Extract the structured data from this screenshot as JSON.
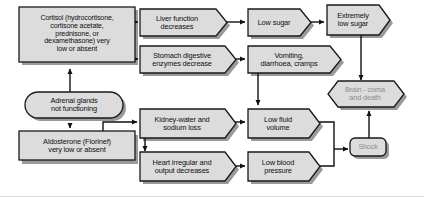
{
  "diagram": {
    "colors": {
      "node_fill": "#dcdcdc",
      "node_stroke": "#1a1a1a",
      "node_shadow": "#9a9a9a",
      "text": "#101010",
      "muted_text": "#8d8d8d",
      "connector": "#111111",
      "background": "#ffffff"
    },
    "nodes": [
      {
        "id": "cortisol",
        "shape": "rectangle",
        "text": "Cortisol (hydrocortisone,\ncortisone acetate,\nprednisone, or\ndexamethasone) very\nlow or absent",
        "muted": false
      },
      {
        "id": "liver-function",
        "shape": "chevron",
        "text": "Liver function\ndecreases",
        "muted": false
      },
      {
        "id": "stomach-enzymes",
        "shape": "chevron",
        "text": "Stomach digestive\nenzymes decrease",
        "muted": false
      },
      {
        "id": "low-sugar",
        "shape": "chevron",
        "text": "Low sugar",
        "muted": false
      },
      {
        "id": "vomiting",
        "shape": "chevron",
        "text": "Vomiting,\ndiarrhoea, cramps",
        "muted": false
      },
      {
        "id": "extremely-low-sugar",
        "shape": "chevron",
        "text": "Extremely\nlow sugar",
        "muted": false
      },
      {
        "id": "adrenal-glands",
        "shape": "rounded",
        "text": "Adrenal glands\nnot functioning",
        "muted": false
      },
      {
        "id": "aldosterone",
        "shape": "rectangle",
        "text": "Aldosterone (Florinef)\nvery low or absent",
        "muted": false
      },
      {
        "id": "kidney-loss",
        "shape": "chevron",
        "text": "Kidney-water and\nsodium loss",
        "muted": false
      },
      {
        "id": "heart-irregular",
        "shape": "chevron",
        "text": "Heart irregular and\noutput decreases",
        "muted": false
      },
      {
        "id": "low-fluid-volume",
        "shape": "chevron",
        "text": "Low fluid\nvolume",
        "muted": false
      },
      {
        "id": "low-blood-pressure",
        "shape": "chevron",
        "text": "Low blood\npressure",
        "muted": false
      },
      {
        "id": "shock",
        "shape": "rounded",
        "text": "Shock",
        "muted": true
      },
      {
        "id": "brain-coma",
        "shape": "hexagon",
        "text": "Brain - coma\nand death",
        "muted": true
      }
    ],
    "edges": [
      {
        "from": "cortisol",
        "to": "liver-function"
      },
      {
        "from": "cortisol",
        "to": "stomach-enzymes"
      },
      {
        "from": "liver-function",
        "to": "low-sugar"
      },
      {
        "from": "low-sugar",
        "to": "extremely-low-sugar"
      },
      {
        "from": "stomach-enzymes",
        "to": "vomiting"
      },
      {
        "from": "extremely-low-sugar",
        "to": "brain-coma"
      },
      {
        "from": "adrenal-glands",
        "to": "cortisol"
      },
      {
        "from": "adrenal-glands",
        "to": "aldosterone"
      },
      {
        "from": "aldosterone",
        "to": "kidney-loss"
      },
      {
        "from": "kidney-loss",
        "to": "heart-irregular"
      },
      {
        "from": "kidney-loss",
        "to": "low-fluid-volume"
      },
      {
        "from": "vomiting",
        "to": "low-fluid-volume"
      },
      {
        "from": "heart-irregular",
        "to": "low-blood-pressure"
      },
      {
        "from": "low-fluid-volume",
        "to": "shock"
      },
      {
        "from": "low-blood-pressure",
        "to": "shock"
      },
      {
        "from": "shock",
        "to": "brain-coma"
      }
    ]
  }
}
